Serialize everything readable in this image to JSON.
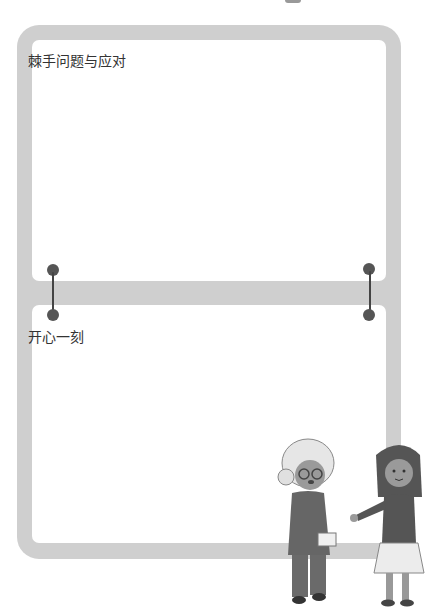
{
  "sections": [
    {
      "title": "棘手问题与应对"
    },
    {
      "title": "开心一刻"
    }
  ],
  "colors": {
    "frame": "#cfcfcf",
    "pin": "#555555",
    "text": "#333333"
  },
  "illustration": {
    "description": "elderly woman holding a cup talking with a girl"
  }
}
